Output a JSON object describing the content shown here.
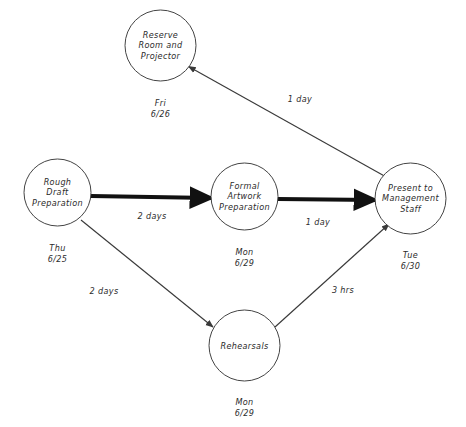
{
  "diagram": {
    "type": "pert-network",
    "stroke_color": "#3a3a3a",
    "critical_color": "#111111",
    "background": "#ffffff"
  },
  "nodes": [
    {
      "id": "reserve-room",
      "label": "Reserve\nRoom and\nProjector",
      "date": "Fri\n6/26",
      "cx": 160.5,
      "cy": 45.5,
      "r": 35.5,
      "date_x": 160.5,
      "date_y": 98
    },
    {
      "id": "rough-draft",
      "label": "Rough\nDraft\nPreparation",
      "date": "Thu\n6/25",
      "cx": 57.5,
      "cy": 192.5,
      "r": 33.5,
      "date_x": 57.5,
      "date_y": 243
    },
    {
      "id": "formal-artwork",
      "label": "Formal\nArtwork\nPreparation",
      "date": "Mon\n6/29",
      "cx": 244.5,
      "cy": 196.5,
      "r": 33.5,
      "date_x": 244.5,
      "date_y": 247
    },
    {
      "id": "present-management",
      "label": "Present to\nManagement\nStaff",
      "date": "Tue\n6/30",
      "cx": 410.5,
      "cy": 198.5,
      "r": 35.5,
      "date_x": 410.5,
      "date_y": 250
    },
    {
      "id": "rehearsals",
      "label": "Rehearsals",
      "date": "Mon\n6/29",
      "cx": 244.5,
      "cy": 345.5,
      "r": 35.5,
      "date_x": 244.5,
      "date_y": 397
    }
  ],
  "edges": [
    {
      "id": "edge-present-to-reserve",
      "from": "present-management",
      "to": "reserve-room",
      "label": "1 day",
      "label_x": 300,
      "label_y": 99,
      "critical": false,
      "x1": 383.5,
      "y1": 175.5,
      "x2": 188.5,
      "y2": 66.5
    },
    {
      "id": "edge-rough-to-formal",
      "from": "rough-draft",
      "to": "formal-artwork",
      "label": "2 days",
      "label_x": 152,
      "label_y": 216,
      "critical": true,
      "x1": 91,
      "y1": 196,
      "x2": 211,
      "y2": 198
    },
    {
      "id": "edge-formal-to-present",
      "from": "formal-artwork",
      "to": "present-management",
      "label": "1 day",
      "label_x": 318,
      "label_y": 222,
      "critical": true,
      "x1": 278,
      "y1": 199,
      "x2": 375,
      "y2": 200
    },
    {
      "id": "edge-rough-to-rehearsals",
      "from": "rough-draft",
      "to": "rehearsals",
      "label": "2 days",
      "label_x": 104,
      "label_y": 291,
      "critical": false,
      "x1": 81,
      "y1": 220,
      "x2": 213,
      "y2": 327
    },
    {
      "id": "edge-rehearsals-to-present",
      "from": "rehearsals",
      "to": "present-management",
      "label": "3 hrs",
      "label_x": 343,
      "label_y": 290,
      "critical": false,
      "x1": 275,
      "y1": 327,
      "x2": 389,
      "y2": 224
    }
  ]
}
